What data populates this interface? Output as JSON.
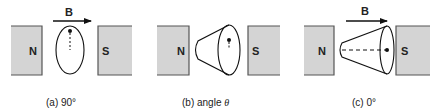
{
  "figure": {
    "field_label": "B",
    "colors": {
      "magnet_fill": "#d4d4d4",
      "magnet_edge": "#555555",
      "line": "#111111"
    },
    "panels": [
      {
        "id": "a",
        "caption": "(a) 90°",
        "north_label": "N",
        "south_label": "S",
        "shows_field_arrow": true,
        "shape": "ellipse"
      },
      {
        "id": "b",
        "caption_prefix": "(b) angle ",
        "caption_symbol": "θ",
        "north_label": "N",
        "south_label": "S",
        "shows_field_arrow": false,
        "shape": "cone"
      },
      {
        "id": "c",
        "caption": "(c) 0°",
        "north_label": "N",
        "south_label": "S",
        "shows_field_arrow": true,
        "shape": "cone-aligned"
      }
    ]
  }
}
